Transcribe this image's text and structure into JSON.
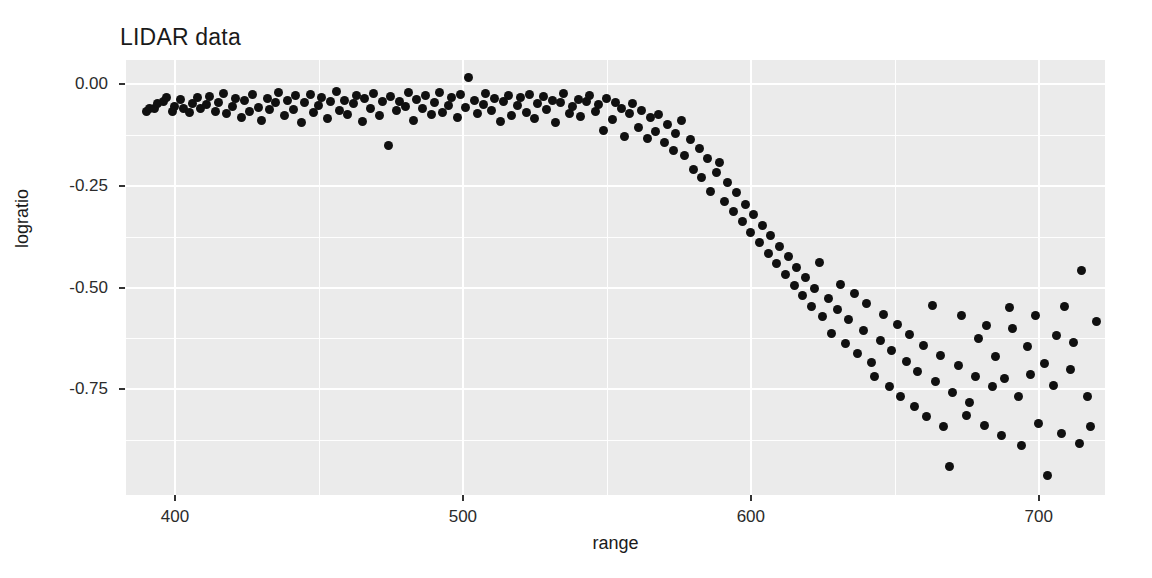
{
  "chart_data": {
    "type": "scatter",
    "title": "LIDAR data",
    "xlabel": "range",
    "ylabel": "logratio",
    "xlim": [
      383,
      723
    ],
    "ylim": [
      -1.01,
      0.06
    ],
    "grid": true,
    "legend": "none",
    "xticks": [
      400,
      500,
      600,
      700
    ],
    "xtick_labels": [
      "400",
      "500",
      "600",
      "700"
    ],
    "yticks": [
      0.0,
      -0.25,
      -0.5,
      -0.75
    ],
    "ytick_labels": [
      "0.00",
      "-0.25",
      "-0.50",
      "-0.75"
    ],
    "x_minor_ticks": [
      450,
      550,
      650,
      700
    ],
    "y_minor_ticks": [
      -0.125,
      -0.375,
      -0.625,
      -0.875
    ],
    "marker": {
      "shape": "circle",
      "color": "#101010",
      "size": 9
    },
    "panel_background": "#ebebeb",
    "gridline_color": "#ffffff",
    "n_points": 221,
    "x": [
      390.0,
      391.0,
      393.0,
      394.0,
      396.0,
      397.0,
      399.0,
      400.0,
      402.0,
      403.0,
      405.0,
      406.0,
      408.0,
      409.0,
      411.0,
      412.0,
      414.0,
      415.0,
      417.0,
      418.0,
      420.0,
      421.0,
      423.0,
      424.0,
      426.0,
      427.0,
      429.0,
      430.0,
      432.0,
      433.0,
      435.0,
      436.0,
      438.0,
      439.0,
      441.0,
      442.0,
      444.0,
      445.0,
      447.0,
      448.0,
      450.0,
      451.0,
      453.0,
      454.0,
      456.0,
      457.0,
      459.0,
      460.0,
      462.0,
      463.0,
      465.0,
      466.0,
      468.0,
      469.0,
      471.0,
      472.0,
      474.0,
      475.0,
      477.0,
      478.0,
      480.0,
      481.0,
      483.0,
      484.0,
      486.0,
      487.0,
      489.0,
      490.0,
      492.0,
      493.0,
      495.0,
      496.0,
      498.0,
      499.0,
      501.0,
      502.0,
      504.0,
      505.0,
      507.0,
      508.0,
      510.0,
      511.0,
      513.0,
      514.0,
      516.0,
      517.0,
      519.0,
      520.0,
      522.0,
      523.0,
      525.0,
      526.0,
      528.0,
      529.0,
      531.0,
      532.0,
      534.0,
      535.0,
      537.0,
      538.0,
      540.0,
      541.0,
      543.0,
      544.0,
      546.0,
      547.0,
      549.0,
      550.0,
      552.0,
      553.0,
      555.0,
      556.0,
      558.0,
      559.0,
      561.0,
      562.0,
      564.0,
      565.0,
      567.0,
      568.0,
      570.0,
      571.0,
      573.0,
      574.0,
      576.0,
      577.0,
      579.0,
      580.0,
      582.0,
      583.0,
      585.0,
      586.0,
      588.0,
      589.0,
      591.0,
      592.0,
      594.0,
      595.0,
      597.0,
      598.0,
      600.0,
      601.0,
      603.0,
      604.0,
      606.0,
      607.0,
      609.0,
      610.0,
      612.0,
      613.0,
      615.0,
      616.0,
      618.0,
      619.0,
      621.0,
      622.0,
      624.0,
      625.0,
      627.0,
      628.0,
      630.0,
      631.0,
      633.0,
      634.0,
      636.0,
      637.0,
      639.0,
      640.0,
      642.0,
      643.0,
      645.0,
      646.0,
      648.0,
      649.0,
      651.0,
      652.0,
      654.0,
      655.0,
      657.0,
      658.0,
      660.0,
      661.0,
      663.0,
      664.0,
      666.0,
      667.0,
      669.0,
      670.0,
      672.0,
      673.0,
      675.0,
      676.0,
      678.0,
      679.0,
      681.0,
      682.0,
      684.0,
      685.0,
      687.0,
      688.0,
      690.0,
      691.0,
      693.0,
      694.0,
      696.0,
      697.0,
      699.0,
      700.0,
      702.0,
      703.0,
      705.0,
      706.0,
      708.0,
      709.0,
      711.0,
      712.0,
      714.0,
      715.0,
      717.0,
      718.0,
      720.0
    ],
    "y": [
      -0.0658,
      -0.0598,
      -0.0581,
      -0.0479,
      -0.0423,
      -0.0327,
      -0.0658,
      -0.0539,
      -0.0376,
      -0.0594,
      -0.0701,
      -0.0475,
      -0.0327,
      -0.0603,
      -0.0504,
      -0.0286,
      -0.0672,
      -0.0434,
      -0.0213,
      -0.0718,
      -0.0552,
      -0.0348,
      -0.0819,
      -0.0408,
      -0.0661,
      -0.0254,
      -0.0571,
      -0.0889,
      -0.0346,
      -0.0624,
      -0.0437,
      -0.0189,
      -0.0763,
      -0.0391,
      -0.0608,
      -0.0281,
      -0.0934,
      -0.0455,
      -0.0237,
      -0.0697,
      -0.0512,
      -0.0315,
      -0.0841,
      -0.0426,
      -0.0183,
      -0.0639,
      -0.0398,
      -0.0732,
      -0.0481,
      -0.0267,
      -0.0906,
      -0.0354,
      -0.0587,
      -0.0225,
      -0.0768,
      -0.0433,
      -0.1512,
      -0.0296,
      -0.0651,
      -0.0419,
      -0.0534,
      -0.0208,
      -0.0877,
      -0.0362,
      -0.0605,
      -0.0278,
      -0.0741,
      -0.0446,
      -0.0193,
      -0.0683,
      -0.0528,
      -0.0321,
      -0.0812,
      -0.0254,
      -0.0572,
      0.0164,
      -0.0398,
      -0.0715,
      -0.0486,
      -0.0231,
      -0.0643,
      -0.0357,
      -0.0904,
      -0.0412,
      -0.0269,
      -0.0758,
      -0.0521,
      -0.0334,
      -0.0687,
      -0.0248,
      -0.0843,
      -0.0471,
      -0.0302,
      -0.0616,
      -0.0389,
      -0.0932,
      -0.0457,
      -0.0214,
      -0.0728,
      -0.0543,
      -0.0366,
      -0.0801,
      -0.0425,
      -0.0279,
      -0.0674,
      -0.0498,
      -0.1143,
      -0.0351,
      -0.0862,
      -0.0436,
      -0.0591,
      -0.1284,
      -0.0723,
      -0.0479,
      -0.1056,
      -0.0638,
      -0.1342,
      -0.0824,
      -0.1167,
      -0.0751,
      -0.1438,
      -0.0983,
      -0.1621,
      -0.1205,
      -0.0894,
      -0.1756,
      -0.1348,
      -0.2094,
      -0.1582,
      -0.2287,
      -0.1831,
      -0.2643,
      -0.2156,
      -0.1927,
      -0.2874,
      -0.2412,
      -0.3125,
      -0.2668,
      -0.3381,
      -0.2947,
      -0.3642,
      -0.3208,
      -0.3895,
      -0.3471,
      -0.4156,
      -0.3723,
      -0.4408,
      -0.3986,
      -0.4672,
      -0.4241,
      -0.4935,
      -0.4503,
      -0.5198,
      -0.4756,
      -0.5462,
      -0.5018,
      -0.4387,
      -0.5721,
      -0.5273,
      -0.6134,
      -0.5536,
      -0.4931,
      -0.6378,
      -0.5789,
      -0.5142,
      -0.6612,
      -0.6043,
      -0.5397,
      -0.6847,
      -0.7194,
      -0.6296,
      -0.5648,
      -0.7428,
      -0.6552,
      -0.5904,
      -0.7683,
      -0.6809,
      -0.6157,
      -0.7931,
      -0.7063,
      -0.6412,
      -0.8176,
      -0.5428,
      -0.7318,
      -0.6668,
      -0.8423,
      -0.9387,
      -0.7573,
      -0.6921,
      -0.5684,
      -0.8147,
      -0.7828,
      -0.7176,
      -0.6243,
      -0.8392,
      -0.5937,
      -0.7431,
      -0.6684,
      -0.8638,
      -0.7243,
      -0.5481,
      -0.6012,
      -0.7687,
      -0.8893,
      -0.6438,
      -0.7142,
      -0.5693,
      -0.8346,
      -0.6867,
      -0.9624,
      -0.7398,
      -0.6184,
      -0.8591,
      -0.5472,
      -0.7023,
      -0.6341,
      -0.8837,
      -0.4583,
      -0.7679,
      -0.8421,
      -0.5828,
      -0.6594,
      -0.9162,
      -0.7256,
      -0.6038,
      -0.8713,
      -0.5347,
      -0.7914,
      -0.6472,
      -0.8268,
      -0.5613,
      -0.7031,
      -0.5732
    ]
  }
}
